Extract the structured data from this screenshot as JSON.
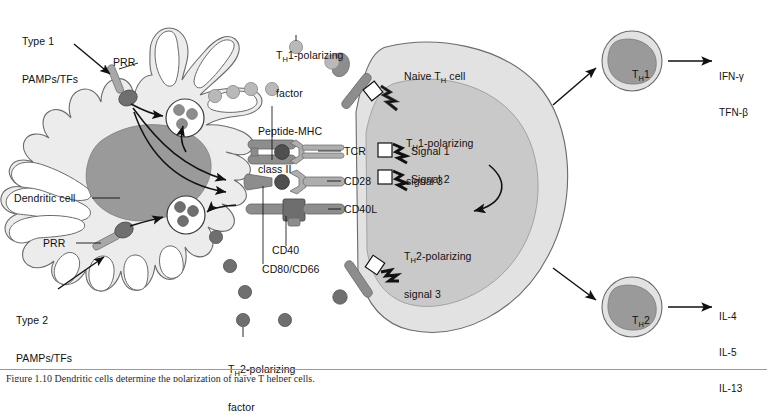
{
  "figure": {
    "background": "#ffffff"
  },
  "colors": {
    "cell_fill": "#ececec",
    "cell_stroke": "#6b6b6b",
    "dc_nucleus": "#9a9a9a",
    "th_cytoplasm": "#e2e2e2",
    "th_nucleus": "#c9c9c9",
    "receptor_gray": "#8d8d8d",
    "receptor_dark": "#6e6e6e",
    "factor_light": "#b9b9b9",
    "factor_dark": "#6f6f6f",
    "line": "#111111",
    "text": "#111111"
  },
  "left_cell": {
    "name_label": "Dendritic cell",
    "stimuli": [
      {
        "id": "type1",
        "label": "Type 1\nPAMPs/TFs"
      },
      {
        "id": "type2",
        "label": "Type 2\nPAMPs/TFs"
      }
    ],
    "receptors": [
      {
        "id": "prr-top",
        "label": "PRR"
      },
      {
        "id": "prr-bottom",
        "label": "PRR"
      }
    ],
    "vesicles": [
      {
        "id": "vesicle-top",
        "granule_count": 3
      },
      {
        "id": "vesicle-bottom",
        "granule_count": 3
      }
    ]
  },
  "secreted_factors": [
    {
      "id": "th1-factor",
      "label": "Tᵴ2‑polarizing",
      "label_text": "TH1-polarizing\nfactor",
      "tone": "light",
      "count": 5
    },
    {
      "id": "th2-factor",
      "label_text": "TH2-polarizing\nfactor",
      "tone": "dark",
      "count": 6
    }
  ],
  "labels": {
    "th1_factor_line1": "T",
    "th1_factor_sub": "H",
    "th1_factor_line1b": "1-polarizing",
    "th1_factor_line2": "factor",
    "th2_factor_line1b": "2-polarizing",
    "th2_factor_line2": "factor",
    "peptide_mhc_line1": "Peptide-MHC",
    "peptide_mhc_line2": "class II",
    "cd40": "CD40",
    "cd80_cd66": "CD80/CD66",
    "dendritic_cell": "Dendritic cell",
    "prr": "PRR",
    "type1_line1": "Type 1",
    "type1_line2": "PAMPs/TFs",
    "type2_line1": "Type 2",
    "type2_line2": "PAMPs/TFs",
    "naive_th_a": "Naive T",
    "naive_th_sub": "H",
    "naive_th_b": " cell",
    "tcr": "TCR",
    "cd28": "CD28",
    "cd40l": "CD40L",
    "signal1": "Signal 1",
    "signal2": "Signal 2",
    "th1_signal3_line1b": "1-polarizing",
    "th1_signal3_line2": "signal 3",
    "th2_signal3_line1b": "2-polarizing",
    "th2_signal3_line2": "signal 3",
    "th1_cell_a": "T",
    "th1_cell_sub": "H",
    "th1_cell_b": "1",
    "th2_cell_b": "2"
  },
  "right_cells": [
    {
      "id": "th1",
      "name": "TH1",
      "cytokines": [
        "IFN-γ",
        "TFN-β"
      ]
    },
    {
      "id": "th2",
      "name": "TH2",
      "cytokines": [
        "IL-4",
        "IL-5",
        "IL-13"
      ]
    }
  ],
  "signals": [
    {
      "id": "signal-th1-3",
      "label": "TH1-polarizing signal 3"
    },
    {
      "id": "signal-1",
      "label": "Signal 1"
    },
    {
      "id": "signal-2",
      "label": "Signal 2"
    },
    {
      "id": "signal-th2-3",
      "label": "TH2-polarizing signal 3"
    }
  ],
  "caption": {
    "text": "Figure 1.10 Dendritic cells determine the polarization of naïve T helper cells."
  }
}
